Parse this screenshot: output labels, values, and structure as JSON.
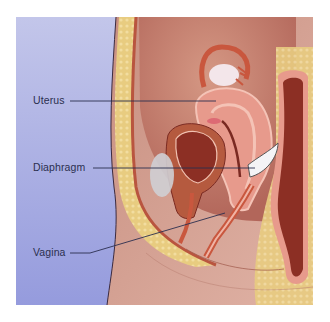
{
  "diagram": {
    "type": "anatomical-illustration",
    "colors": {
      "background_blue": "#b9bde6",
      "background_blue_bottom": "#9aa0de",
      "skin": "#d7a597",
      "fat": "#e9cf86",
      "muscle": "#c9735e",
      "tissue_dark": "#8c2f24",
      "tissue_pink": "#e79a8c",
      "label_text": "#2b2f4f",
      "leader_line": "#2b2f4f"
    },
    "labels": [
      {
        "id": "uterus",
        "text": "Uterus"
      },
      {
        "id": "diaphragm",
        "text": "Diaphragm"
      },
      {
        "id": "vagina",
        "text": "Vagina"
      }
    ]
  }
}
